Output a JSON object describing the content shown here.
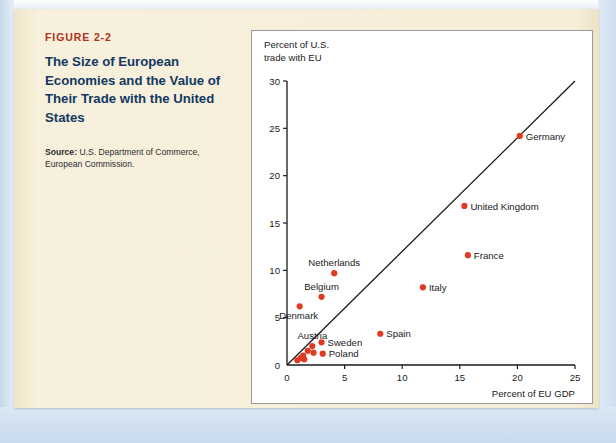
{
  "figure": {
    "number": "FIGURE 2-2",
    "title": "The Size of European Economies and the Value of Their Trade with the United States",
    "source_label": "Source:",
    "source_text": " U.S. Department of Commerce, European Commission."
  },
  "colors": {
    "figure_number": "#b23019",
    "title": "#123962",
    "dot": "#e03a20",
    "panel": "#f5edd7",
    "card": "#ffffff",
    "axis": "#1a1a1a",
    "page": "#cfdff0"
  },
  "chart_data": {
    "type": "scatter",
    "title": "",
    "xlabel": "Percent of EU GDP",
    "ylabel": "Percent of U.S. trade with EU",
    "ylabel_line1": "Percent of U.S.",
    "ylabel_line2": "trade with EU",
    "xlim": [
      0,
      25
    ],
    "ylim": [
      0,
      30
    ],
    "xticks": [
      0,
      5,
      10,
      15,
      20,
      25
    ],
    "yticks": [
      0,
      5,
      10,
      15,
      20,
      25,
      30
    ],
    "grid": false,
    "legend": "none",
    "reference_line": {
      "description": "45-degree line from origin to top-right corner",
      "from": [
        0,
        0
      ],
      "to": [
        25,
        30
      ]
    },
    "points": [
      {
        "label": "Germany",
        "x": 20.2,
        "y": 24.2,
        "label_pos": "right"
      },
      {
        "label": "United Kingdom",
        "x": 15.4,
        "y": 16.8,
        "label_pos": "right"
      },
      {
        "label": "France",
        "x": 15.7,
        "y": 11.6,
        "label_pos": "right"
      },
      {
        "label": "Italy",
        "x": 11.8,
        "y": 8.2,
        "label_pos": "right"
      },
      {
        "label": "Spain",
        "x": 8.1,
        "y": 3.3,
        "label_pos": "right"
      },
      {
        "label": "Netherlands",
        "x": 4.1,
        "y": 9.7,
        "label_pos": "above"
      },
      {
        "label": "Belgium",
        "x": 3.0,
        "y": 7.2,
        "label_pos": "above"
      },
      {
        "label": "Denmark",
        "x": 1.1,
        "y": 6.2,
        "label_pos": "below"
      },
      {
        "label": "Sweden",
        "x": 3.0,
        "y": 2.4,
        "label_pos": "right"
      },
      {
        "label": "Austria",
        "x": 2.2,
        "y": 2.0,
        "label_pos": "above"
      },
      {
        "label": "Poland",
        "x": 3.1,
        "y": 1.2,
        "label_pos": "right"
      },
      {
        "label": "",
        "x": 1.8,
        "y": 1.5,
        "label_pos": "none"
      },
      {
        "label": "",
        "x": 2.3,
        "y": 1.3,
        "label_pos": "none"
      },
      {
        "label": "",
        "x": 1.4,
        "y": 1.0,
        "label_pos": "none"
      },
      {
        "label": "",
        "x": 1.2,
        "y": 0.75,
        "label_pos": "none"
      },
      {
        "label": "",
        "x": 1.5,
        "y": 0.6,
        "label_pos": "none"
      },
      {
        "label": "",
        "x": 0.9,
        "y": 0.5,
        "label_pos": "none"
      }
    ]
  }
}
